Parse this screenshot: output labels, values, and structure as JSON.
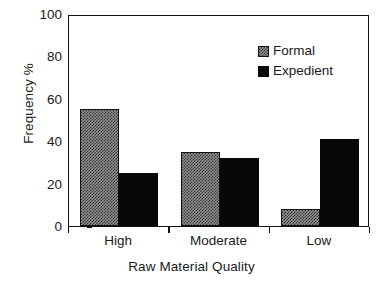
{
  "chart_data": {
    "type": "bar",
    "title": "",
    "xlabel": "Raw Material Quality",
    "ylabel": "Frequency %",
    "categories": [
      "High",
      "Moderate",
      "Low"
    ],
    "series": [
      {
        "name": "Formal",
        "values": [
          55,
          35,
          8
        ]
      },
      {
        "name": "Expedient",
        "values": [
          25,
          32,
          41
        ]
      }
    ],
    "ylim": [
      0,
      100
    ],
    "yticks": [
      0,
      20,
      40,
      60,
      80,
      100
    ],
    "ytick_labels": [
      "0",
      "20",
      "40",
      "60",
      "80",
      "100"
    ],
    "grid": false,
    "legend_position": "top-right",
    "colors": {
      "formal": "#8d8d8d",
      "expedient": "#080808",
      "axis": "#111111",
      "background": "#ffffff"
    }
  }
}
